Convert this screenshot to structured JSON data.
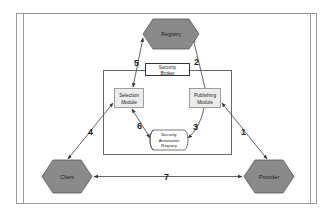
{
  "diagram": {
    "colors": {
      "hexagon_fill": "#8a8a8a",
      "hexagon_stroke": "#555555",
      "module_fill": "#ececec",
      "line": "#555555",
      "frame": "#9a9a9a"
    },
    "nodes": {
      "registry": "Registry",
      "client": "Client",
      "provider": "Provider",
      "security_broker": [
        "Security",
        "Broker"
      ],
      "selection_module": [
        "Selection",
        "Module"
      ],
      "publishing_module": [
        "Publishing",
        "Module"
      ],
      "security_annotation_registry": [
        "Security",
        "Annotation",
        "Registry"
      ]
    },
    "edges": [
      {
        "label": "1",
        "from": "Publishing Module",
        "to": "Provider",
        "bidirectional": true
      },
      {
        "label": "2",
        "from": "Publishing Module",
        "to": "Registry",
        "bidirectional": false
      },
      {
        "label": "3",
        "from": "Publishing Module",
        "to": "Security Annotation Registry",
        "bidirectional": false
      },
      {
        "label": "4",
        "from": "Selection Module",
        "to": "Client",
        "bidirectional": true
      },
      {
        "label": "5",
        "from": "Registry",
        "to": "Selection Module",
        "bidirectional": true
      },
      {
        "label": "6",
        "from": "Selection Module",
        "to": "Security Annotation Registry",
        "bidirectional": true
      },
      {
        "label": "7",
        "from": "Client",
        "to": "Provider",
        "bidirectional": true
      }
    ]
  }
}
